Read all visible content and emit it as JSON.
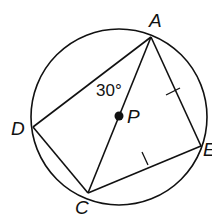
{
  "diagram": {
    "type": "inscribed-quadrilateral-in-circle",
    "stroke_color": "#111111",
    "background": "#ffffff",
    "circle": {
      "center_label": "P",
      "cx": 119,
      "cy": 117,
      "r": 88
    },
    "points": {
      "A": {
        "label": "A",
        "x": 151,
        "y": 37
      },
      "D": {
        "label": "D",
        "x": 33,
        "y": 127
      },
      "C": {
        "label": "C",
        "x": 88,
        "y": 193
      },
      "E": {
        "label": "E",
        "x": 201,
        "y": 146
      },
      "P": {
        "label": "P",
        "x": 119,
        "y": 116
      }
    },
    "segments": [
      "AD",
      "DC",
      "CE",
      "EA",
      "AC"
    ],
    "congruence_marks": [
      "AE",
      "CE"
    ],
    "angle_annotation": {
      "text": "30°",
      "at_vertex": "A",
      "between": [
        "DA",
        "AC"
      ]
    }
  }
}
